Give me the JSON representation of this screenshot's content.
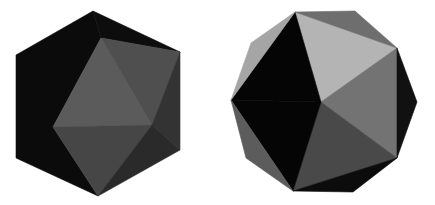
{
  "figure": {
    "views": [
      {
        "name": "icosahedron-vertex-view",
        "outline": "hexagon",
        "faces": [
          {
            "points": "93,11 16,55 16,158 98,196 53,127 101,38",
            "fill": "#0b0b0b"
          },
          {
            "points": "93,11 101,38 180,52",
            "fill": "#0d0d0d"
          },
          {
            "points": "101,38 53,127 152,125",
            "fill": "#5b5b5b"
          },
          {
            "points": "101,38 152,125 180,52",
            "fill": "#4f4f4f"
          },
          {
            "points": "53,127 152,125 98,196",
            "fill": "#464646"
          },
          {
            "points": "152,125 180,52 180,150",
            "fill": "#333333"
          },
          {
            "points": "152,125 180,150 98,196",
            "fill": "#2a2a2a"
          }
        ]
      },
      {
        "name": "icosahedron-face-view",
        "outline": "decagon",
        "faces": [
          {
            "points": "321,102 295,12 397,48",
            "fill": "#b4b4b4"
          },
          {
            "points": "321,102 397,48 397,158",
            "fill": "#737373"
          },
          {
            "points": "321,102 397,158 293,191",
            "fill": "#494949"
          },
          {
            "points": "321,102 293,191 231,100",
            "fill": "#050505"
          },
          {
            "points": "321,102 231,100 295,12",
            "fill": "#050505"
          },
          {
            "points": "295,12 251,43 231,100",
            "fill": "#a5a5a5"
          },
          {
            "points": "295,12 355,11 397,48",
            "fill": "#6e6e6e"
          },
          {
            "points": "397,48 417,102 397,158",
            "fill": "#111111"
          },
          {
            "points": "397,158 353,192 293,191",
            "fill": "#0c0c0c"
          },
          {
            "points": "293,191 246,158 231,100",
            "fill": "#5c5c5c"
          }
        ]
      }
    ]
  }
}
